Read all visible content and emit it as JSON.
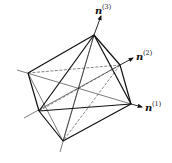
{
  "diagram": {
    "labels": {
      "n1": {
        "base": "n",
        "sup": "(1)"
      },
      "n2": {
        "base": "n",
        "sup": "(2)"
      },
      "n3": {
        "base": "n",
        "sup": "(3)"
      }
    },
    "vertices": {
      "top": [
        94,
        35
      ],
      "upper_right": [
        120,
        65
      ],
      "right": [
        131,
        104
      ],
      "left_upper": [
        28,
        73
      ],
      "left_lower": [
        39,
        111
      ],
      "bottom": [
        63,
        141
      ]
    },
    "stroke_color": "#111111"
  }
}
